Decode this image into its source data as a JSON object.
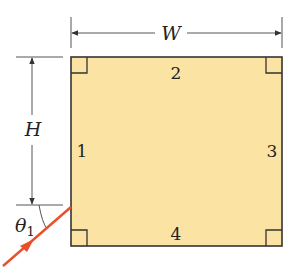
{
  "diagram": {
    "type": "rectangle-optics-geometry",
    "dimensions": {
      "width_label": "W",
      "height_label": "H"
    },
    "sides": [
      {
        "id": 1,
        "label": "1",
        "position": "left"
      },
      {
        "id": 2,
        "label": "2",
        "position": "top"
      },
      {
        "id": 3,
        "label": "3",
        "position": "right"
      },
      {
        "id": 4,
        "label": "4",
        "position": "bottom"
      }
    ],
    "incident_ray": {
      "angle_label": "θ",
      "angle_subscript": "1",
      "color": "#e8502a"
    },
    "colors": {
      "fill": "#fbe3a4",
      "outline": "#333333",
      "dimension_lines": "#555555"
    }
  }
}
